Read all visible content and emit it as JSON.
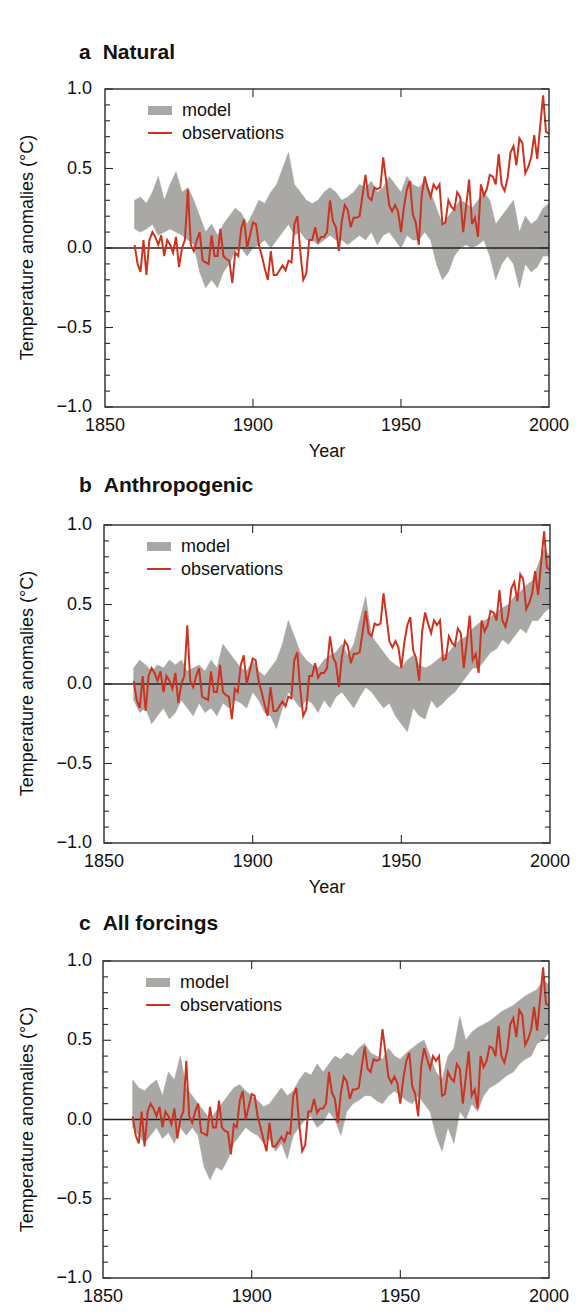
{
  "colors": {
    "model_band": "#aaa8a4",
    "observations": "#cc3320",
    "axis": "#2a2a2a",
    "zero_line": "#222222"
  },
  "legend": {
    "model_label": "model",
    "observations_label": "observations"
  },
  "axes": {
    "ylabel": "Temperature anomalies (°C)",
    "xlabel": "Year",
    "xticks": [
      1850,
      1900,
      1950,
      2000
    ],
    "xtick_labels": [
      "1850",
      "1900",
      "1950",
      "2000"
    ],
    "yticks": [
      1.0,
      0.5,
      0.0,
      -0.5,
      -1.0
    ],
    "ytick_labels": [
      "1.0",
      "0.5",
      "0.0",
      "−0.5",
      "−1.0"
    ],
    "xlim": [
      1850,
      2000
    ],
    "ylim": [
      -1.0,
      1.0
    ]
  },
  "panels": [
    {
      "letter": "a",
      "title": "Natural",
      "show_xlabel": true
    },
    {
      "letter": "b",
      "title": "Anthropogenic",
      "show_xlabel": true
    },
    {
      "letter": "c",
      "title": "All forcings",
      "show_xlabel": false
    }
  ],
  "chart_data": [
    {
      "type": "area",
      "title": "a  Natural",
      "xlabel": "Year",
      "ylabel": "Temperature anomalies (°C)",
      "xlim": [
        1850,
        2000
      ],
      "ylim": [
        -1.0,
        1.0
      ],
      "grid": false,
      "legend_position": "upper left",
      "legend": [
        "model",
        "observations"
      ],
      "x_start": 1860,
      "x_step": 2,
      "series": [
        {
          "name": "model",
          "kind": "band",
          "lower": [
            0.12,
            0.1,
            0.12,
            0.15,
            0.08,
            0.1,
            0.12,
            0.1,
            0.08,
            0.05,
            0.02,
            -0.15,
            -0.25,
            -0.2,
            -0.25,
            -0.15,
            -0.1,
            -0.02,
            0.0,
            -0.05,
            0.0,
            0.02,
            0.05,
            0.0,
            0.05,
            0.1,
            0.15,
            0.08,
            0.1,
            0.05,
            0.05,
            0.02,
            0.05,
            0.08,
            0.05,
            0.05,
            0.02,
            0.05,
            0.08,
            0.05,
            0.1,
            0.02,
            0.08,
            0.1,
            0.05,
            0.0,
            0.08,
            0.05,
            0.05,
            0.1,
            0.05,
            -0.1,
            -0.2,
            -0.15,
            -0.05,
            0.0,
            0.02,
            0.0,
            0.02,
            0.05,
            -0.05,
            -0.2,
            -0.1,
            -0.05,
            -0.1,
            -0.25,
            -0.1,
            -0.15,
            -0.12,
            -0.05,
            -0.05
          ],
          "upper": [
            0.3,
            0.32,
            0.28,
            0.35,
            0.45,
            0.3,
            0.4,
            0.48,
            0.35,
            0.38,
            0.3,
            0.2,
            0.1,
            0.15,
            0.08,
            0.15,
            0.2,
            0.25,
            0.22,
            0.15,
            0.22,
            0.3,
            0.28,
            0.35,
            0.4,
            0.5,
            0.6,
            0.4,
            0.35,
            0.3,
            0.28,
            0.3,
            0.35,
            0.38,
            0.35,
            0.3,
            0.32,
            0.35,
            0.4,
            0.38,
            0.42,
            0.35,
            0.38,
            0.45,
            0.4,
            0.35,
            0.45,
            0.4,
            0.38,
            0.42,
            0.35,
            0.25,
            0.15,
            0.2,
            0.25,
            0.3,
            0.28,
            0.25,
            0.3,
            0.35,
            0.3,
            0.15,
            0.2,
            0.25,
            0.3,
            0.1,
            0.2,
            0.15,
            0.18,
            0.25,
            0.28
          ]
        },
        {
          "name": "observations",
          "kind": "line",
          "ref": "observations"
        }
      ]
    },
    {
      "type": "area",
      "title": "b  Anthropogenic",
      "xlabel": "Year",
      "ylabel": "Temperature anomalies (°C)",
      "xlim": [
        1850,
        2000
      ],
      "ylim": [
        -1.0,
        1.0
      ],
      "grid": false,
      "legend_position": "upper left",
      "legend": [
        "model",
        "observations"
      ],
      "x_start": 1860,
      "x_step": 2,
      "series": [
        {
          "name": "model",
          "kind": "band",
          "lower": [
            -0.1,
            -0.18,
            -0.15,
            -0.25,
            -0.2,
            -0.15,
            -0.22,
            -0.18,
            -0.1,
            -0.15,
            -0.2,
            -0.12,
            -0.18,
            -0.15,
            -0.2,
            -0.12,
            -0.15,
            -0.1,
            -0.12,
            -0.15,
            -0.05,
            -0.1,
            -0.18,
            -0.2,
            -0.28,
            -0.15,
            -0.05,
            -0.1,
            -0.15,
            -0.1,
            -0.12,
            -0.18,
            -0.1,
            -0.15,
            -0.08,
            -0.05,
            -0.1,
            -0.15,
            -0.08,
            -0.02,
            -0.05,
            -0.1,
            -0.15,
            -0.12,
            -0.2,
            -0.25,
            -0.3,
            -0.15,
            -0.2,
            -0.22,
            -0.1,
            -0.15,
            -0.12,
            -0.08,
            -0.05,
            0.0,
            0.05,
            0.1,
            0.1,
            0.15,
            0.2,
            0.22,
            0.28,
            0.25,
            0.3,
            0.35,
            0.32,
            0.4,
            0.4,
            0.45,
            0.48
          ],
          "upper": [
            0.1,
            0.15,
            0.12,
            0.08,
            0.12,
            0.1,
            0.15,
            0.12,
            0.15,
            0.08,
            0.1,
            0.12,
            0.08,
            0.15,
            0.1,
            0.25,
            0.2,
            0.15,
            0.1,
            0.08,
            0.15,
            0.08,
            0.05,
            0.1,
            0.15,
            0.25,
            0.4,
            0.3,
            0.2,
            0.15,
            0.12,
            0.1,
            0.15,
            0.18,
            0.2,
            0.25,
            0.18,
            0.25,
            0.4,
            0.55,
            0.3,
            0.25,
            0.2,
            0.15,
            0.12,
            0.1,
            0.15,
            0.18,
            0.12,
            0.1,
            0.12,
            0.15,
            0.18,
            0.2,
            0.25,
            0.28,
            0.3,
            0.35,
            0.38,
            0.4,
            0.42,
            0.45,
            0.48,
            0.5,
            0.55,
            0.58,
            0.62,
            0.65,
            0.75,
            0.85,
            0.8
          ]
        },
        {
          "name": "observations",
          "kind": "line",
          "ref": "observations"
        }
      ]
    },
    {
      "type": "area",
      "title": "c  All forcings",
      "xlabel": "",
      "ylabel": "Temperature anomalies (°C)",
      "xlim": [
        1850,
        2000
      ],
      "ylim": [
        -1.0,
        1.0
      ],
      "grid": false,
      "legend_position": "upper left",
      "legend": [
        "model",
        "observations"
      ],
      "x_start": 1860,
      "x_step": 2,
      "series": [
        {
          "name": "model",
          "kind": "band",
          "lower": [
            -0.05,
            -0.1,
            -0.15,
            -0.1,
            -0.05,
            -0.12,
            -0.08,
            -0.15,
            -0.05,
            -0.1,
            -0.05,
            -0.1,
            -0.3,
            -0.38,
            -0.3,
            -0.32,
            -0.25,
            -0.15,
            -0.1,
            -0.05,
            -0.08,
            -0.1,
            -0.15,
            -0.12,
            -0.2,
            -0.15,
            -0.25,
            -0.1,
            -0.05,
            0.0,
            0.02,
            -0.05,
            -0.02,
            0.05,
            0.0,
            -0.1,
            0.05,
            0.1,
            0.12,
            0.15,
            0.15,
            0.12,
            0.1,
            0.15,
            0.18,
            0.15,
            0.12,
            0.1,
            0.15,
            0.1,
            0.05,
            -0.1,
            -0.2,
            -0.05,
            -0.15,
            0.05,
            0.0,
            0.1,
            0.05,
            0.15,
            0.2,
            0.22,
            0.25,
            0.28,
            0.3,
            0.35,
            0.38,
            0.4,
            0.48,
            0.5,
            0.55
          ],
          "upper": [
            0.25,
            0.2,
            0.18,
            0.22,
            0.25,
            0.15,
            0.3,
            0.25,
            0.4,
            0.2,
            0.15,
            0.1,
            0.05,
            0.0,
            0.05,
            0.1,
            0.15,
            0.2,
            0.22,
            0.18,
            0.15,
            0.12,
            0.08,
            0.1,
            0.15,
            0.2,
            0.15,
            0.18,
            0.25,
            0.3,
            0.28,
            0.35,
            0.3,
            0.35,
            0.4,
            0.38,
            0.42,
            0.4,
            0.45,
            0.48,
            0.42,
            0.4,
            0.38,
            0.45,
            0.4,
            0.38,
            0.42,
            0.45,
            0.48,
            0.5,
            0.4,
            0.3,
            0.25,
            0.4,
            0.45,
            0.65,
            0.5,
            0.55,
            0.58,
            0.6,
            0.62,
            0.65,
            0.68,
            0.7,
            0.72,
            0.75,
            0.78,
            0.8,
            0.82,
            0.88,
            0.85
          ]
        },
        {
          "name": "observations",
          "kind": "line",
          "ref": "observations"
        }
      ]
    }
  ],
  "observations": {
    "x_start": 1860,
    "values": [
      0.02,
      -0.1,
      -0.15,
      0.05,
      -0.17,
      0.05,
      0.1,
      0.07,
      0.02,
      0.08,
      -0.05,
      0.05,
      0.02,
      -0.03,
      0.07,
      -0.12,
      0.0,
      0.05,
      0.37,
      0.02,
      -0.02,
      0.05,
      0.1,
      -0.08,
      -0.09,
      -0.1,
      0.08,
      -0.05,
      -0.05,
      0.12,
      -0.05,
      -0.07,
      -0.08,
      -0.22,
      -0.03,
      -0.05,
      0.12,
      0.18,
      0.0,
      0.08,
      0.16,
      0.15,
      0.02,
      -0.05,
      -0.13,
      -0.2,
      -0.02,
      -0.17,
      -0.17,
      -0.14,
      -0.11,
      -0.14,
      -0.08,
      -0.09,
      0.15,
      0.2,
      -0.03,
      -0.2,
      -0.16,
      0.05,
      0.05,
      0.13,
      0.04,
      0.07,
      0.07,
      0.1,
      0.3,
      0.17,
      0.13,
      -0.02,
      0.17,
      0.27,
      0.24,
      0.13,
      0.19,
      0.19,
      0.2,
      0.33,
      0.46,
      0.32,
      0.3,
      0.38,
      0.37,
      0.38,
      0.57,
      0.42,
      0.27,
      0.23,
      0.27,
      0.23,
      0.1,
      0.26,
      0.37,
      0.42,
      0.21,
      0.16,
      0.02,
      0.33,
      0.45,
      0.38,
      0.32,
      0.4,
      0.37,
      0.4,
      0.15,
      0.16,
      0.3,
      0.26,
      0.24,
      0.35,
      0.32,
      0.1,
      0.26,
      0.43,
      0.15,
      0.19,
      0.07,
      0.4,
      0.33,
      0.37,
      0.46,
      0.45,
      0.4,
      0.59,
      0.4,
      0.36,
      0.44,
      0.6,
      0.64,
      0.52,
      0.69,
      0.66,
      0.47,
      0.51,
      0.57,
      0.71,
      0.56,
      0.76,
      0.96,
      0.73,
      0.72
    ]
  }
}
